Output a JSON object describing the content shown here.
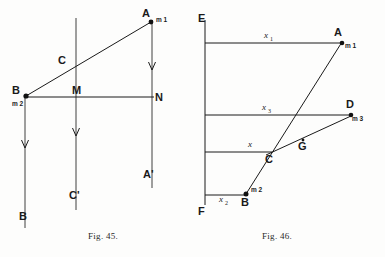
{
  "page": {
    "background": "#fdfdfc",
    "ink": "#1a1a1a",
    "width": 385,
    "height": 257
  },
  "figures": [
    {
      "id": "fig-45",
      "caption": "Fig. 45.",
      "points": [
        {
          "name": "A",
          "label": "A",
          "sub": "m 1",
          "x": 152,
          "y": 14
        },
        {
          "name": "B",
          "label": "B",
          "sub": "m 2",
          "x": 25,
          "y": 95
        },
        {
          "name": "C",
          "label": "C",
          "sub": "",
          "x": 65,
          "y": 61
        },
        {
          "name": "M",
          "label": "M",
          "sub": "",
          "x": 76,
          "y": 97
        },
        {
          "name": "N",
          "label": "N",
          "sub": "",
          "x": 152,
          "y": 97
        },
        {
          "name": "A2",
          "label": "A'",
          "sub": "",
          "x": 152,
          "y": 175
        },
        {
          "name": "C2",
          "label": "C'",
          "sub": "",
          "x": 76,
          "y": 196
        },
        {
          "name": "B2",
          "label": "B",
          "sub": "",
          "x": 25,
          "y": 216
        }
      ],
      "vectors": [
        "B-to-A diagonal",
        "A downward arrow",
        "M downward arrow",
        "B downward arrow"
      ]
    },
    {
      "id": "fig-46",
      "caption": "Fig. 46.",
      "points": [
        {
          "name": "E",
          "label": "E",
          "sub": "",
          "x": 202,
          "y": 18
        },
        {
          "name": "A",
          "label": "A",
          "sub": "m 1",
          "x": 341,
          "y": 25
        },
        {
          "name": "D",
          "label": "D",
          "sub": "m 3",
          "x": 351,
          "y": 110
        },
        {
          "name": "C",
          "label": "C",
          "sub": "",
          "x": 270,
          "y": 150
        },
        {
          "name": "G",
          "label": "G",
          "sub": "",
          "x": 302,
          "y": 143
        },
        {
          "name": "B",
          "label": "B",
          "sub": "m 2",
          "x": 245,
          "y": 196
        },
        {
          "name": "F",
          "label": "F",
          "sub": "",
          "x": 202,
          "y": 208
        }
      ],
      "distances": [
        {
          "name": "x1",
          "label": "x",
          "sub": "1",
          "x": 265,
          "y": 28
        },
        {
          "name": "x3",
          "label": "x",
          "sub": "3",
          "x": 263,
          "y": 110
        },
        {
          "name": "x",
          "label": "x",
          "sub": "",
          "x": 250,
          "y": 146
        },
        {
          "name": "x2",
          "label": "x",
          "sub": "2",
          "x": 222,
          "y": 203
        }
      ]
    }
  ]
}
